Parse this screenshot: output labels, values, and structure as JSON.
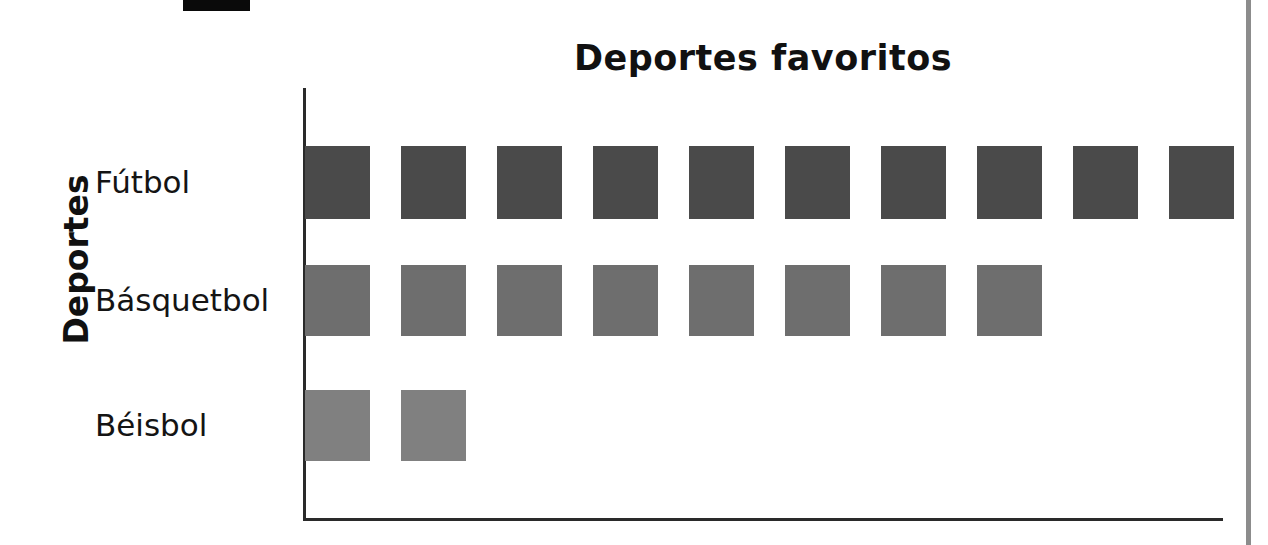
{
  "page": {
    "background_color": "#ffffff",
    "artifacts": {
      "top_black_mark": "black-mark",
      "right_page_edge": "page-edge-line",
      "edge_color": "#8c8c8c"
    }
  },
  "chart_data": {
    "type": "bar",
    "title": "Deportes favoritos",
    "xlabel": "",
    "ylabel": "Deportes",
    "orientation": "horizontal",
    "pictograph": true,
    "unit_symbol": "square",
    "grid": false,
    "legend": "none",
    "categories": [
      "Fútbol",
      "Básquetbol",
      "Béisbol"
    ],
    "values": [
      10,
      8,
      2
    ],
    "xlim": [
      0,
      10
    ],
    "series": [
      {
        "name": "Deportes favoritos",
        "values": [
          10,
          8,
          2
        ]
      }
    ],
    "bars": [
      {
        "category": "Fútbol",
        "count": 10,
        "color": "#4a4a4a"
      },
      {
        "category": "Básquetbol",
        "count": 8,
        "color": "#6e6e6e"
      },
      {
        "category": "Béisbol",
        "count": 2,
        "color": "#808080"
      }
    ],
    "axis_color": "#2a2a2a"
  }
}
